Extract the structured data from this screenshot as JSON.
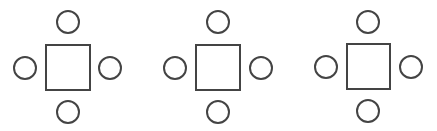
{
  "diagram": {
    "width": 437,
    "height": 131,
    "background": "#ffffff",
    "stroke_color": "#444444",
    "stroke_width": 2,
    "groups": [
      {
        "name": "table-group-1",
        "table": {
          "x": 46,
          "y": 45,
          "w": 44,
          "h": 45
        },
        "chairs": [
          {
            "position": "top",
            "cx": 68,
            "cy": 22,
            "r": 11
          },
          {
            "position": "left",
            "cx": 25,
            "cy": 68,
            "r": 11
          },
          {
            "position": "right",
            "cx": 110,
            "cy": 68,
            "r": 11
          },
          {
            "position": "bottom",
            "cx": 68,
            "cy": 112,
            "r": 11
          }
        ]
      },
      {
        "name": "table-group-2",
        "table": {
          "x": 196,
          "y": 45,
          "w": 44,
          "h": 45
        },
        "chairs": [
          {
            "position": "top",
            "cx": 218,
            "cy": 22,
            "r": 11
          },
          {
            "position": "left",
            "cx": 175,
            "cy": 68,
            "r": 11
          },
          {
            "position": "right",
            "cx": 261,
            "cy": 68,
            "r": 11
          },
          {
            "position": "bottom",
            "cx": 218,
            "cy": 112,
            "r": 11
          }
        ]
      },
      {
        "name": "table-group-3",
        "table": {
          "x": 347,
          "y": 44,
          "w": 43,
          "h": 45
        },
        "chairs": [
          {
            "position": "top",
            "cx": 368,
            "cy": 22,
            "r": 11
          },
          {
            "position": "left",
            "cx": 326,
            "cy": 67,
            "r": 11
          },
          {
            "position": "right",
            "cx": 411,
            "cy": 67,
            "r": 11
          },
          {
            "position": "bottom",
            "cx": 368,
            "cy": 111,
            "r": 11
          }
        ]
      }
    ]
  }
}
